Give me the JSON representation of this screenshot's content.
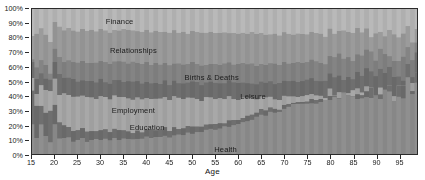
{
  "chart_data": {
    "type": "area",
    "title": "",
    "subtitle": "",
    "xlabel": "Age",
    "ylabel": "",
    "stacked": true,
    "normalized": true,
    "grid": false,
    "legend_position": "inline-labels",
    "xlim": [
      15,
      99
    ],
    "ylim": [
      0,
      100
    ],
    "x_ticks": [
      15,
      20,
      25,
      30,
      35,
      40,
      45,
      50,
      55,
      60,
      65,
      70,
      75,
      80,
      85,
      90,
      95
    ],
    "y_ticks": [
      "0%",
      "10%",
      "20%",
      "30%",
      "40%",
      "50%",
      "60%",
      "70%",
      "80%",
      "90%",
      "100%"
    ],
    "y_tick_values": [
      0,
      10,
      20,
      30,
      40,
      50,
      60,
      70,
      80,
      90,
      100
    ],
    "x": [
      15,
      16,
      17,
      18,
      19,
      20,
      21,
      22,
      23,
      24,
      25,
      26,
      27,
      28,
      29,
      30,
      31,
      32,
      33,
      34,
      35,
      36,
      37,
      38,
      39,
      40,
      41,
      42,
      43,
      44,
      45,
      46,
      47,
      48,
      49,
      50,
      51,
      52,
      53,
      54,
      55,
      56,
      57,
      58,
      59,
      60,
      61,
      62,
      63,
      64,
      65,
      66,
      67,
      68,
      69,
      70,
      71,
      72,
      73,
      74,
      75,
      76,
      77,
      78,
      79,
      80,
      81,
      82,
      83,
      84,
      85,
      86,
      87,
      88,
      89,
      90,
      91,
      92,
      93,
      94,
      95,
      96,
      97,
      98,
      99
    ],
    "series": [
      {
        "name": "Health",
        "color": "#8f8f8f",
        "label_x": 57,
        "label_y": 5,
        "values": [
          20,
          12,
          22,
          14,
          10,
          18,
          12,
          10,
          11,
          9,
          9,
          10,
          9,
          10,
          10,
          9,
          10,
          10,
          11,
          10,
          11,
          11,
          10,
          11,
          11,
          12,
          11,
          12,
          12,
          13,
          12,
          13,
          13,
          14,
          14,
          15,
          15,
          16,
          16,
          17,
          17,
          18,
          19,
          19,
          20,
          21,
          22,
          23,
          24,
          25,
          26,
          27,
          28,
          29,
          30,
          31,
          32,
          33,
          34,
          34,
          35,
          36,
          37,
          37,
          38,
          39,
          39,
          40,
          41,
          42,
          42,
          43,
          44,
          44,
          45,
          44,
          46,
          43,
          47,
          44,
          46,
          42,
          48,
          43,
          45
        ]
      },
      {
        "name": "Education",
        "color": "#6f6f6f",
        "label_x": 40,
        "label_y": 20,
        "values": [
          22,
          24,
          16,
          20,
          18,
          12,
          10,
          9,
          8,
          8,
          7,
          7,
          7,
          7,
          6,
          6,
          6,
          6,
          6,
          6,
          6,
          6,
          5,
          6,
          5,
          5,
          5,
          5,
          5,
          5,
          5,
          5,
          4,
          5,
          4,
          4,
          4,
          4,
          4,
          4,
          4,
          4,
          3,
          4,
          3,
          3,
          3,
          3,
          3,
          3,
          3,
          3,
          2,
          3,
          2,
          2,
          2,
          2,
          2,
          2,
          2,
          2,
          2,
          2,
          2,
          2,
          2,
          2,
          2,
          2,
          2,
          2,
          2,
          2,
          2,
          2,
          2,
          3,
          2,
          2,
          2,
          3,
          2,
          2,
          2
        ]
      },
      {
        "name": "Employment",
        "color": "#a8a8a8",
        "label_x": 37,
        "label_y": 31,
        "values": [
          6,
          8,
          10,
          12,
          16,
          18,
          20,
          22,
          22,
          23,
          23,
          23,
          23,
          23,
          23,
          23,
          23,
          23,
          23,
          23,
          23,
          23,
          23,
          22,
          22,
          22,
          22,
          22,
          21,
          21,
          21,
          21,
          21,
          20,
          20,
          20,
          19,
          19,
          18,
          18,
          18,
          17,
          16,
          16,
          15,
          14,
          13,
          12,
          11,
          10,
          9,
          8,
          7,
          7,
          6,
          6,
          5,
          5,
          4,
          4,
          4,
          3,
          3,
          3,
          3,
          3,
          2,
          2,
          2,
          2,
          2,
          2,
          2,
          2,
          2,
          2,
          2,
          2,
          2,
          2,
          2,
          2,
          2,
          2,
          2
        ]
      },
      {
        "name": "Leisure",
        "color": "#6f6f6f",
        "label_x": 63,
        "label_y": 41,
        "values": [
          8,
          10,
          9,
          10,
          10,
          11,
          11,
          11,
          11,
          11,
          11,
          11,
          11,
          11,
          11,
          11,
          11,
          11,
          11,
          11,
          11,
          11,
          11,
          11,
          11,
          11,
          11,
          11,
          11,
          11,
          11,
          11,
          11,
          11,
          11,
          11,
          11,
          11,
          11,
          11,
          11,
          11,
          11,
          11,
          11,
          11,
          11,
          11,
          11,
          11,
          11,
          11,
          11,
          11,
          11,
          11,
          11,
          11,
          11,
          11,
          11,
          11,
          11,
          11,
          11,
          11,
          11,
          11,
          11,
          11,
          11,
          11,
          11,
          11,
          10,
          10,
          10,
          10,
          10,
          10,
          10,
          10,
          10,
          10,
          10
        ]
      },
      {
        "name": "Births & Deaths",
        "color": "#848484",
        "label_x": 54,
        "label_y": 54,
        "values": [
          6,
          6,
          7,
          7,
          8,
          9,
          10,
          11,
          12,
          12,
          13,
          13,
          13,
          13,
          13,
          13,
          13,
          13,
          13,
          13,
          13,
          13,
          13,
          13,
          13,
          13,
          13,
          13,
          13,
          13,
          13,
          13,
          13,
          13,
          13,
          13,
          13,
          13,
          13,
          13,
          13,
          13,
          13,
          13,
          13,
          13,
          13,
          13,
          13,
          13,
          13,
          13,
          13,
          13,
          13,
          13,
          13,
          13,
          13,
          13,
          13,
          13,
          13,
          13,
          13,
          13,
          13,
          13,
          13,
          13,
          13,
          13,
          13,
          13,
          13,
          13,
          13,
          13,
          13,
          13,
          13,
          13,
          13,
          13,
          13
        ]
      },
      {
        "name": "Relationships",
        "color": "#9b9b9b",
        "label_x": 37,
        "label_y": 72,
        "values": [
          20,
          22,
          20,
          21,
          22,
          22,
          22,
          22,
          22,
          22,
          22,
          22,
          22,
          22,
          22,
          22,
          22,
          22,
          22,
          22,
          22,
          22,
          22,
          22,
          22,
          22,
          22,
          22,
          22,
          22,
          22,
          22,
          22,
          22,
          22,
          22,
          22,
          22,
          22,
          22,
          22,
          22,
          21,
          21,
          21,
          21,
          21,
          21,
          21,
          21,
          21,
          21,
          21,
          21,
          21,
          20,
          20,
          20,
          20,
          20,
          20,
          20,
          20,
          20,
          20,
          19,
          19,
          19,
          19,
          19,
          19,
          19,
          18,
          18,
          18,
          18,
          17,
          17,
          17,
          17,
          16,
          16,
          16,
          16,
          16
        ]
      },
      {
        "name": "Finance",
        "color": "#b9b9b9",
        "label_x": 34,
        "label_y": 92,
        "values": [
          18,
          18,
          16,
          16,
          16,
          10,
          15,
          15,
          14,
          15,
          15,
          14,
          15,
          14,
          15,
          15,
          15,
          15,
          14,
          15,
          14,
          15,
          15,
          15,
          16,
          15,
          16,
          15,
          16,
          15,
          16,
          15,
          16,
          15,
          17,
          16,
          17,
          16,
          17,
          16,
          17,
          16,
          17,
          16,
          17,
          17,
          17,
          17,
          17,
          18,
          17,
          18,
          18,
          17,
          18,
          17,
          18,
          17,
          18,
          17,
          17,
          17,
          17,
          17,
          17,
          17,
          17,
          17,
          17,
          17,
          17,
          17,
          17,
          17,
          17,
          18,
          17,
          18,
          17,
          18,
          18,
          18,
          17,
          18,
          18
        ]
      }
    ],
    "annotations": [
      {
        "text": "Finance",
        "x": 34,
        "y": 92
      },
      {
        "text": "Relationships",
        "x": 37,
        "y": 72
      },
      {
        "text": "Births & Deaths",
        "x": 54,
        "y": 54
      },
      {
        "text": "Leisure",
        "x": 63,
        "y": 41
      },
      {
        "text": "Employment",
        "x": 37,
        "y": 31
      },
      {
        "text": "Education",
        "x": 40,
        "y": 20
      },
      {
        "text": "Health",
        "x": 57,
        "y": 5
      }
    ],
    "colors": {
      "finance": "#b9b9b9",
      "relationships": "#9b9b9b",
      "births_and_deaths": "#848484",
      "leisure": "#6f6f6f",
      "employment": "#a8a8a8",
      "education": "#6f6f6f",
      "health": "#8f8f8f",
      "axis": "#2b2b2b",
      "text": "#1a1a1a",
      "background": "#ffffff"
    }
  }
}
